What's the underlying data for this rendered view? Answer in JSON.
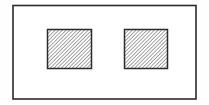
{
  "figure": {
    "canvas": {
      "width": 209,
      "height": 105,
      "background_color": "#fefefe"
    },
    "style": {
      "stroke_color": "#2b2b2b",
      "fill_color": "#ffffff",
      "hatch_color": "#6e6e6e",
      "hatch_angle_degrees": 45,
      "hatch_spacing_px": 2,
      "hatch_stroke_width_px": 1
    },
    "shapes": [
      {
        "name": "outer-rectangle",
        "type": "rectangle",
        "x": 13,
        "y": 5.5,
        "width": 183,
        "height": 93.5,
        "stroke_width": 1.6,
        "filled": false,
        "hatched": false
      },
      {
        "name": "left-square",
        "type": "square",
        "x": 47.5,
        "y": 29.5,
        "width": 44,
        "height": 39,
        "stroke_width": 1.5,
        "filled": false,
        "hatched": true
      },
      {
        "name": "right-square",
        "type": "square",
        "x": 124.5,
        "y": 29.5,
        "width": 43,
        "height": 39,
        "stroke_width": 1.5,
        "filled": false,
        "hatched": true
      }
    ],
    "labels": [],
    "annotations": []
  }
}
